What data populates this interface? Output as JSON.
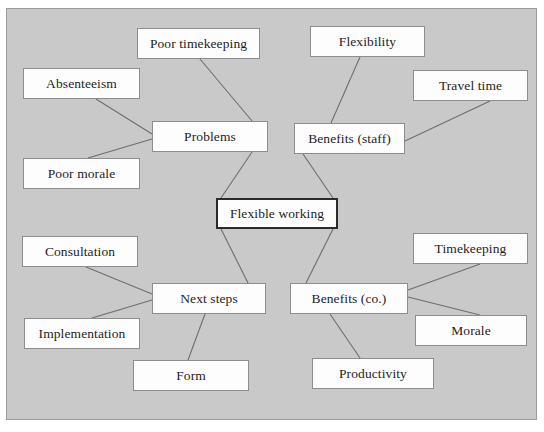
{
  "diagram": {
    "type": "mind-map",
    "background_color": "#c9c9c9",
    "node_fill_color": "#fdfdfd",
    "node_border_color": "#8d8d8d",
    "center_border_color": "#2b2b2b",
    "edge_color": "#6e6e6e",
    "frame": {
      "x": 6,
      "y": 8,
      "width": 531,
      "height": 412
    },
    "center_node": {
      "id": "flexible-working",
      "label": "Flexible working",
      "x": 216,
      "y": 198,
      "width": 122,
      "height": 31
    },
    "nodes": [
      {
        "id": "poor-timekeeping",
        "label": "Poor timekeeping",
        "x": 137,
        "y": 28,
        "width": 123,
        "height": 31
      },
      {
        "id": "absenteeism",
        "label": "Absenteeism",
        "x": 23,
        "y": 68,
        "width": 117,
        "height": 31
      },
      {
        "id": "problems",
        "label": "Problems",
        "x": 152,
        "y": 121,
        "width": 116,
        "height": 31
      },
      {
        "id": "poor-morale",
        "label": "Poor morale",
        "x": 23,
        "y": 158,
        "width": 117,
        "height": 31
      },
      {
        "id": "flexibility",
        "label": "Flexibility",
        "x": 310,
        "y": 26,
        "width": 115,
        "height": 31
      },
      {
        "id": "travel-time",
        "label": "Travel time",
        "x": 413,
        "y": 70,
        "width": 115,
        "height": 31
      },
      {
        "id": "benefits-staff",
        "label": "Benefits (staff)",
        "x": 294,
        "y": 123,
        "width": 111,
        "height": 31
      },
      {
        "id": "consultation",
        "label": "Consultation",
        "x": 22,
        "y": 236,
        "width": 116,
        "height": 31
      },
      {
        "id": "next-steps",
        "label": "Next steps",
        "x": 152,
        "y": 283,
        "width": 114,
        "height": 31
      },
      {
        "id": "implementation",
        "label": "Implementation",
        "x": 24,
        "y": 318,
        "width": 116,
        "height": 31
      },
      {
        "id": "form",
        "label": "Form",
        "x": 133,
        "y": 360,
        "width": 116,
        "height": 31
      },
      {
        "id": "benefits-co",
        "label": "Benefits (co.)",
        "x": 290,
        "y": 283,
        "width": 118,
        "height": 31
      },
      {
        "id": "timekeeping",
        "label": "Timekeeping",
        "x": 413,
        "y": 233,
        "width": 115,
        "height": 31
      },
      {
        "id": "morale",
        "label": "Morale",
        "x": 415,
        "y": 315,
        "width": 112,
        "height": 31
      },
      {
        "id": "productivity",
        "label": "Productivity",
        "x": 312,
        "y": 358,
        "width": 122,
        "height": 31
      }
    ],
    "edges": [
      {
        "from": "flexible-working",
        "to": "problems",
        "x1": 221,
        "y1": 198,
        "x2": 252,
        "y2": 152
      },
      {
        "from": "flexible-working",
        "to": "benefits-staff",
        "x1": 333,
        "y1": 198,
        "x2": 303,
        "y2": 154
      },
      {
        "from": "flexible-working",
        "to": "next-steps",
        "x1": 221,
        "y1": 229,
        "x2": 248,
        "y2": 283
      },
      {
        "from": "flexible-working",
        "to": "benefits-co",
        "x1": 333,
        "y1": 229,
        "x2": 306,
        "y2": 283
      },
      {
        "from": "problems",
        "to": "poor-timekeeping",
        "x1": 252,
        "y1": 121,
        "x2": 200,
        "y2": 59
      },
      {
        "from": "problems",
        "to": "absenteeism",
        "x1": 152,
        "y1": 134,
        "x2": 96,
        "y2": 99
      },
      {
        "from": "problems",
        "to": "poor-morale",
        "x1": 152,
        "y1": 139,
        "x2": 88,
        "y2": 158
      },
      {
        "from": "benefits-staff",
        "to": "flexibility",
        "x1": 331,
        "y1": 123,
        "x2": 360,
        "y2": 57
      },
      {
        "from": "benefits-staff",
        "to": "travel-time",
        "x1": 405,
        "y1": 141,
        "x2": 490,
        "y2": 101
      },
      {
        "from": "next-steps",
        "to": "consultation",
        "x1": 152,
        "y1": 294,
        "x2": 86,
        "y2": 267
      },
      {
        "from": "next-steps",
        "to": "implementation",
        "x1": 152,
        "y1": 300,
        "x2": 92,
        "y2": 318
      },
      {
        "from": "next-steps",
        "to": "form",
        "x1": 205,
        "y1": 314,
        "x2": 188,
        "y2": 360
      },
      {
        "from": "benefits-co",
        "to": "timekeeping",
        "x1": 408,
        "y1": 290,
        "x2": 480,
        "y2": 264
      },
      {
        "from": "benefits-co",
        "to": "morale",
        "x1": 408,
        "y1": 297,
        "x2": 480,
        "y2": 315
      },
      {
        "from": "benefits-co",
        "to": "productivity",
        "x1": 330,
        "y1": 314,
        "x2": 360,
        "y2": 358
      }
    ]
  }
}
